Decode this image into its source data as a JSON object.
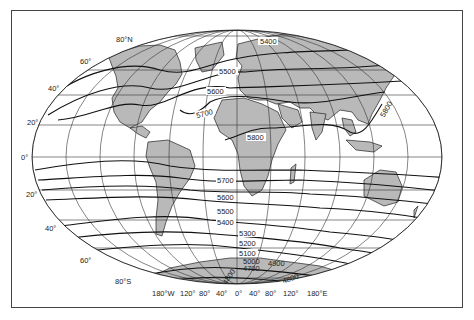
{
  "map": {
    "type": "world-contour-map",
    "projection": "elliptical (Robinson-like)",
    "colors": {
      "land": "#b9b9b9",
      "ocean": "#ffffff",
      "lines": "#222222",
      "frame": "#444444"
    },
    "latitude_labels": [
      "80°N",
      "60°",
      "40°",
      "20°",
      "0°",
      "20°",
      "40°",
      "60°",
      "80°S"
    ],
    "longitude_labels": [
      "180°W",
      "120°",
      "80°",
      "40°",
      "0°",
      "40°",
      "80°",
      "120°",
      "180°E"
    ],
    "contour_labels": {
      "north": [
        "5400",
        "5500",
        "5600",
        "5700",
        "5800",
        "5800"
      ],
      "south": [
        "5700",
        "5600",
        "5500",
        "5400",
        "5300",
        "5200",
        "5100",
        "5000",
        "4900",
        "4700",
        "4800",
        "4800"
      ]
    }
  }
}
